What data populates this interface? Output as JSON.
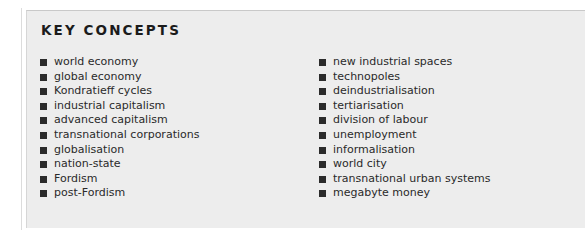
{
  "panel": {
    "title": "KEY CONCEPTS",
    "background_color": "#ededed",
    "text_color": "#2a2a2a",
    "bullet_color": "#2b2b2b",
    "bullet_icon": "filled-square-bullet"
  },
  "columns": [
    {
      "name": "left",
      "items": [
        {
          "label": "world economy"
        },
        {
          "label": "global economy"
        },
        {
          "label": "Kondratieff cycles"
        },
        {
          "label": "industrial capitalism"
        },
        {
          "label": "advanced capitalism"
        },
        {
          "label": "transnational corporations"
        },
        {
          "label": "globalisation"
        },
        {
          "label": "nation-state"
        },
        {
          "label": "Fordism"
        },
        {
          "label": "post-Fordism"
        }
      ]
    },
    {
      "name": "right",
      "items": [
        {
          "label": "new industrial spaces"
        },
        {
          "label": "technopoles"
        },
        {
          "label": "deindustrialisation"
        },
        {
          "label": "tertiarisation"
        },
        {
          "label": "division of labour"
        },
        {
          "label": "unemployment"
        },
        {
          "label": "informalisation"
        },
        {
          "label": "world city"
        },
        {
          "label": "transnational urban systems"
        },
        {
          "label": "megabyte money"
        }
      ]
    }
  ]
}
